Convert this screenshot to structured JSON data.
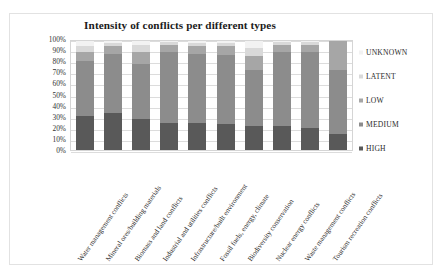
{
  "chart_data": {
    "type": "bar",
    "subtype": "stacked-100-percent",
    "title": "Intensity of conflicts per different types",
    "xlabel": "",
    "ylabel": "",
    "ylim": [
      0,
      100
    ],
    "ytick_labels": [
      "100%",
      "90%",
      "80%",
      "70%",
      "60%",
      "50%",
      "40%",
      "30%",
      "20%",
      "10%",
      "0%"
    ],
    "ytick_values": [
      100,
      90,
      80,
      70,
      60,
      50,
      40,
      30,
      20,
      10,
      0
    ],
    "grid": true,
    "legend_position": "right",
    "legend_order_top_to_bottom": [
      "UNKNOWN",
      "LATENT",
      "LOW",
      "MEDIUM",
      "HIGH"
    ],
    "categories": [
      "Water management conflicts",
      "Mineral ores/building materials",
      "Biomass and land conflicts",
      "Industrial and utilities conflicts",
      "Infrastructure/built environment",
      "Fossil fuels, energy, climate",
      "Biodiversity conservation",
      "Nuclear energy conflicts",
      "Waste management conflicts",
      "Tourism recreation conflicts"
    ],
    "series": [
      {
        "name": "HIGH",
        "color": "#595959",
        "values": [
          31,
          34,
          28,
          25,
          25,
          24,
          22,
          22,
          20,
          15
        ]
      },
      {
        "name": "MEDIUM",
        "color": "#8c8c8c",
        "values": [
          51,
          54,
          51,
          65,
          63,
          63,
          51,
          68,
          70,
          58
        ]
      },
      {
        "name": "LOW",
        "color": "#a6a6a6",
        "values": [
          8,
          7,
          11,
          6,
          7,
          8,
          13,
          6,
          6,
          27
        ]
      },
      {
        "name": "LATENT",
        "color": "#d9d9d9",
        "values": [
          5,
          3,
          6,
          3,
          3,
          3,
          8,
          3,
          3,
          0
        ]
      },
      {
        "name": "UNKNOWN",
        "color": "#f2f2f2",
        "values": [
          5,
          2,
          4,
          1,
          2,
          2,
          6,
          1,
          1,
          0
        ]
      }
    ]
  },
  "colors": {
    "high": "#595959",
    "medium": "#8c8c8c",
    "low": "#a6a6a6",
    "latent": "#d9d9d9",
    "unknown": "#f2f2f2",
    "frame": "#e2e2e2",
    "gridline": "#dcdcdc",
    "text": "#2a2a2a"
  }
}
